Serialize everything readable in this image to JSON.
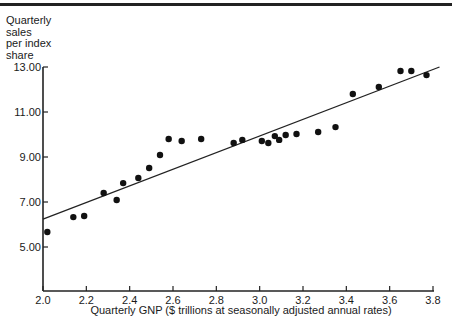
{
  "chart_data": {
    "type": "scatter",
    "title": "",
    "xlabel": "Quarterly GNP ($ trillions at seasonally adjusted annual rates)",
    "ylabel": "Quarterly\nsales\nper index\nshare",
    "xlim": [
      2.0,
      3.8
    ],
    "ylim": [
      3.0,
      13.0
    ],
    "x_ticks": [
      "2.0",
      "2.2",
      "2.4",
      "2.6",
      "2.8",
      "3.0",
      "3.2",
      "3.4",
      "3.6",
      "3.8"
    ],
    "y_ticks": [
      "13.00",
      "11.00",
      "9.00",
      "7.00",
      "5.00"
    ],
    "grid": false,
    "legend": null,
    "series": [
      {
        "name": "Observed quarters",
        "points": [
          [
            2.02,
            5.67
          ],
          [
            2.14,
            6.33
          ],
          [
            2.19,
            6.38
          ],
          [
            2.28,
            7.4
          ],
          [
            2.34,
            7.09
          ],
          [
            2.37,
            7.84
          ],
          [
            2.44,
            8.07
          ],
          [
            2.49,
            8.51
          ],
          [
            2.54,
            9.09
          ],
          [
            2.58,
            9.8
          ],
          [
            2.64,
            9.71
          ],
          [
            2.73,
            9.8
          ],
          [
            2.88,
            9.62
          ],
          [
            2.92,
            9.76
          ],
          [
            3.01,
            9.71
          ],
          [
            3.04,
            9.62
          ],
          [
            3.07,
            9.93
          ],
          [
            3.09,
            9.76
          ],
          [
            3.12,
            9.98
          ],
          [
            3.17,
            10.02
          ],
          [
            3.27,
            10.11
          ],
          [
            3.35,
            10.33
          ],
          [
            3.43,
            11.8
          ],
          [
            3.55,
            12.11
          ],
          [
            3.65,
            12.82
          ],
          [
            3.7,
            12.82
          ],
          [
            3.77,
            12.64
          ]
        ]
      }
    ],
    "fit_line": {
      "type": "linear",
      "start": [
        2.0,
        6.24
      ],
      "end": [
        3.83,
        13.0
      ]
    }
  },
  "labels": {
    "ylabel": "Quarterly\nsales\nper index\nshare",
    "xlabel": "Quarterly GNP ($ trillions at seasonally adjusted annual rates)"
  }
}
